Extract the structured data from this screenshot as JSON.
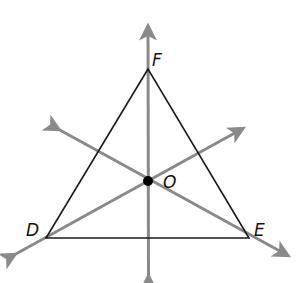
{
  "diagram": {
    "colors": {
      "triangle": "#1a1a1a",
      "lines": "#8a8a8a",
      "point": "#000000",
      "background": "#ffffff"
    },
    "vertices": {
      "F": {
        "label": "F",
        "x": 148,
        "y": 69
      },
      "D": {
        "label": "D",
        "x": 46,
        "y": 238
      },
      "E": {
        "label": "E",
        "x": 249,
        "y": 238
      }
    },
    "center_point": {
      "label": "O",
      "x": 148,
      "y": 181
    },
    "lines": [
      {
        "name": "vertical-line-through-F",
        "from": [
          148,
          25
        ],
        "to": [
          149,
          279
        ],
        "arrows": "both"
      },
      {
        "name": "line-through-D-and-O",
        "from": [
          12,
          256
        ],
        "to": [
          244,
          128
        ],
        "arrows": "both"
      },
      {
        "name": "line-through-E-and-O",
        "from": [
          56,
          128
        ],
        "to": [
          289,
          256
        ],
        "arrows": "both"
      }
    ],
    "labels": {
      "F": "F",
      "D": "D",
      "E": "E",
      "O": "O"
    }
  }
}
